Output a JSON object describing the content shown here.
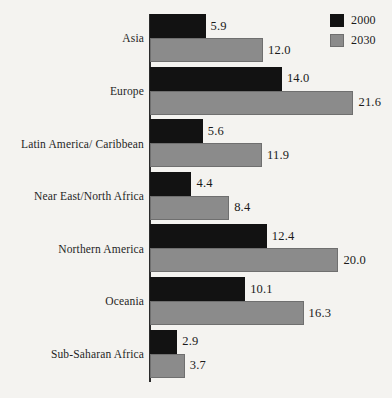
{
  "chart_data": {
    "type": "bar",
    "orientation": "horizontal",
    "title": "",
    "subtitle": "",
    "xlabel": "",
    "ylabel": "",
    "grid": false,
    "legend_position": "top-right",
    "xlim": [
      0,
      22.5
    ],
    "categories": [
      "Asia",
      "Europe",
      "Latin America/ Caribbean",
      "Near East/North Africa",
      "Northern America",
      "Oceania",
      "Sub-Saharan Africa"
    ],
    "series": [
      {
        "name": "2000",
        "color": "#121212",
        "values": [
          5.9,
          14.0,
          5.6,
          4.4,
          12.4,
          10.1,
          2.9
        ],
        "labels": [
          "5.9",
          "14.0",
          "5.6",
          "4.4",
          "12.4",
          "10.1",
          "2.9"
        ]
      },
      {
        "name": "2030",
        "color": "#8b8b8b",
        "values": [
          12.0,
          21.6,
          11.9,
          8.4,
          20.0,
          16.3,
          3.7
        ],
        "labels": [
          "12.0",
          "21.6",
          "11.9",
          "8.4",
          "20.0",
          "16.3",
          "3.7"
        ]
      }
    ]
  },
  "legend": {
    "items": [
      {
        "label": "2000",
        "swatch": "legend-swatch-2000"
      },
      {
        "label": "2030",
        "swatch": "legend-swatch-2030"
      }
    ]
  },
  "colors": {
    "background": "#f4f3f0",
    "series_2000": "#121212",
    "series_2030": "#8b8b8b",
    "axis": "#2b2b2b",
    "text": "#1a1a1a"
  }
}
